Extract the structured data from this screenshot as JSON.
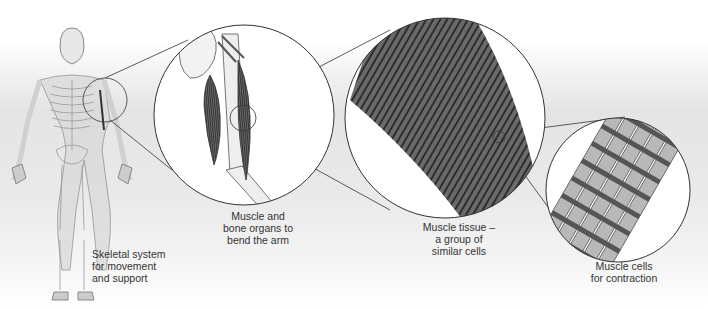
{
  "diagram": {
    "colors": {
      "background_band": "#e6e6e6",
      "outline": "#333333",
      "muscle_dark": "#555555",
      "muscle_stripe": "#888888",
      "cell_light": "#b8b8b8",
      "cell_band": "#5a5a5a"
    },
    "panels": [
      {
        "id": "skeleton",
        "label_lines": [
          "Skeletal system",
          "for movement",
          "and support"
        ]
      },
      {
        "id": "arm",
        "label_lines": [
          "Muscle and",
          "bone organs to",
          "bend the arm"
        ]
      },
      {
        "id": "tissue",
        "label_lines": [
          "Muscle tissue –",
          "a group of",
          "similar cells"
        ]
      },
      {
        "id": "cells",
        "label_lines": [
          "Muscle cells",
          "for contraction"
        ]
      }
    ]
  }
}
